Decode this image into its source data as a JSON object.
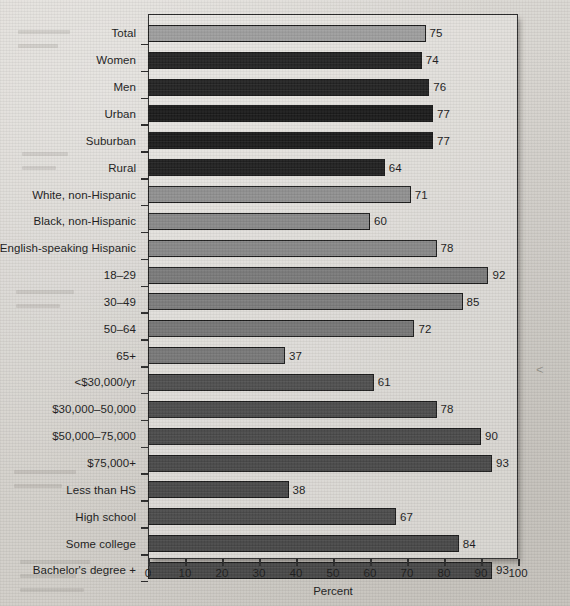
{
  "chart_data": {
    "type": "bar",
    "orientation": "horizontal",
    "title": "",
    "subtitle": "",
    "xlabel": "Percent",
    "ylabel": "",
    "xlim": [
      0,
      100
    ],
    "xticks": [
      0,
      10,
      20,
      30,
      40,
      50,
      60,
      70,
      80,
      90,
      100
    ],
    "xticklabels": [
      "0",
      "10",
      "20",
      "30",
      "40",
      "50",
      "60",
      "70",
      "80",
      "90",
      "100"
    ],
    "grid": false,
    "legend": "none",
    "value_labels": true,
    "categories": [
      "Total",
      "Women",
      "Men",
      "Urban",
      "Suburban",
      "Rural",
      "White, non-Hispanic",
      "Black, non-Hispanic",
      "English-speaking Hispanic",
      "18–29",
      "30–49",
      "50–64",
      "65+",
      "<$30,000/yr",
      "$30,000–50,000",
      "$50,000–75,000",
      "$75,000+",
      "Less than HS",
      "High school",
      "Some college",
      "Bachelor's degree +"
    ],
    "values": [
      75,
      74,
      76,
      77,
      77,
      64,
      71,
      60,
      78,
      92,
      85,
      72,
      37,
      61,
      78,
      90,
      93,
      38,
      67,
      84,
      93
    ],
    "bar_colors": [
      "#a3a3a3",
      "#1d1d1d",
      "#1d1d1d",
      "#141414",
      "#151515",
      "#1a1a1a",
      "#949494",
      "#8d8d8d",
      "#8b8b8b",
      "#7c7c7c",
      "#7e7e7e",
      "#787878",
      "#7a7a7a",
      "#4d4d4d",
      "#4a4a4a",
      "#484848",
      "#474747",
      "#464646",
      "#494949",
      "#454545",
      "#444444"
    ]
  },
  "colors": {
    "axis": "#2b2b2b",
    "text": "#1b1b1b",
    "paper": "#d8d6d2",
    "plot_background": "#e9e7e3"
  }
}
